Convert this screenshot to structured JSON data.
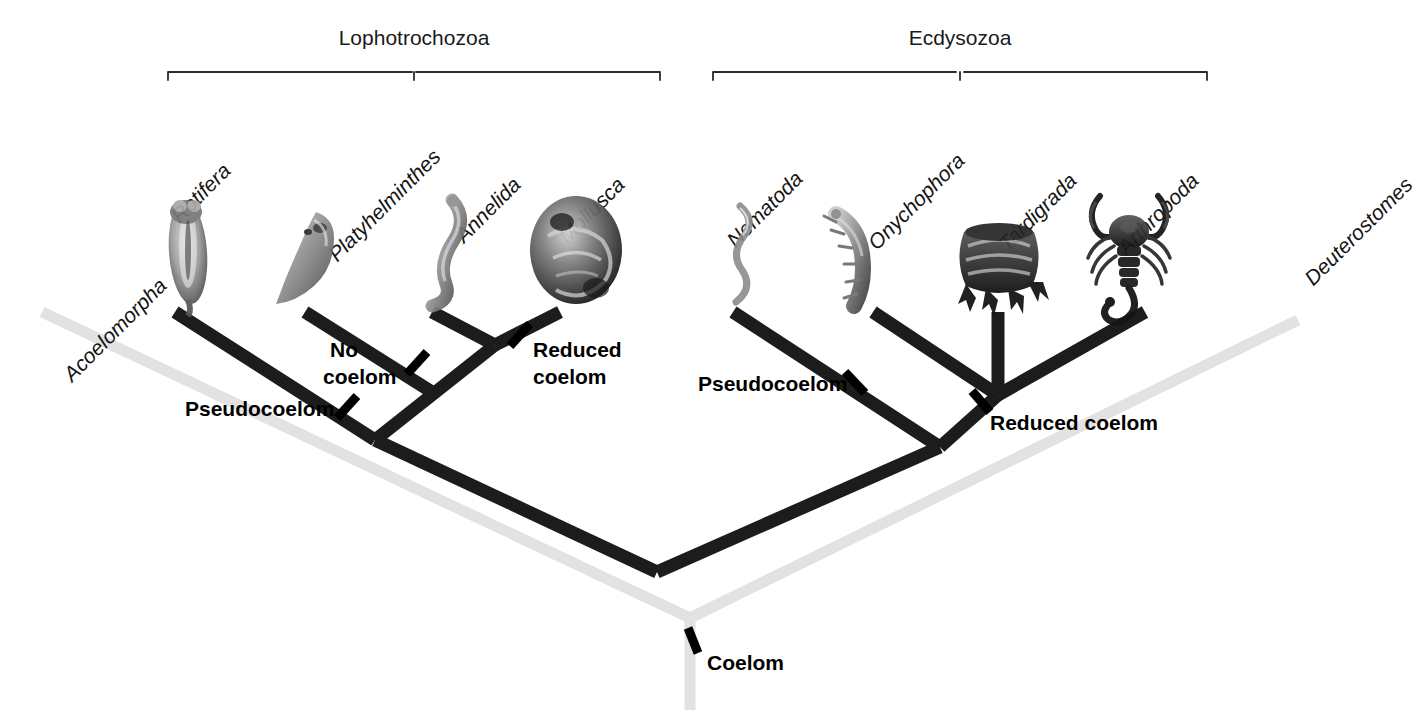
{
  "figure": {
    "type": "phylogenetic-cladogram",
    "title": "",
    "background_color": "#ffffff",
    "dark_branch_color": "#1c1c1c",
    "gray_branch_color": "#e2e2e2",
    "text_color": "#141414"
  },
  "clades": [
    {
      "id": "lophotrochozoa",
      "label": "Lophotrochozoa",
      "bracket_x1": 168,
      "bracket_x2": 660,
      "bracket_y": 72,
      "label_x": 414,
      "label_y": 45
    },
    {
      "id": "ecdysozoa",
      "label": "Ecdysozoa",
      "bracket_x1": 713,
      "bracket_x2": 1207,
      "bracket_y": 72,
      "label_x": 960,
      "label_y": 45
    }
  ],
  "taxa": [
    {
      "id": "acoelomorpha",
      "label": "Acoelomorpha",
      "label_x": 168,
      "label_y": 287,
      "tip_x": 42,
      "tip_y": 312,
      "group": "outgroup-gray"
    },
    {
      "id": "rotifera",
      "label": "Rotifera",
      "label_x": 232,
      "label_y": 170,
      "tip_x": 175,
      "tip_y": 312,
      "group": "lophotrochozoa"
    },
    {
      "id": "platyhelminthes",
      "label": "Platyhelminthes",
      "label_x": 432,
      "label_y": 170,
      "tip_x": 305,
      "tip_y": 312,
      "group": "lophotrochozoa"
    },
    {
      "id": "annelida",
      "label": "Annelida",
      "label_x": 520,
      "label_y": 186,
      "tip_x": 432,
      "tip_y": 312,
      "group": "lophotrochozoa"
    },
    {
      "id": "mollusca",
      "label": "Mollusca",
      "label_x": 620,
      "label_y": 186,
      "tip_x": 560,
      "tip_y": 312,
      "group": "lophotrochozoa"
    },
    {
      "id": "nematoda",
      "label": "Nematoda",
      "label_x": 800,
      "label_y": 180,
      "tip_x": 733,
      "tip_y": 312,
      "group": "ecdysozoa"
    },
    {
      "id": "onychophora",
      "label": "Onychophora",
      "label_x": 960,
      "label_y": 170,
      "tip_x": 873,
      "tip_y": 312,
      "group": "ecdysozoa"
    },
    {
      "id": "tardigrada",
      "label": "Tardigrada",
      "label_x": 1072,
      "label_y": 182,
      "tip_x": 998,
      "tip_y": 312,
      "group": "ecdysozoa"
    },
    {
      "id": "arthropoda",
      "label": "Arthropoda",
      "label_x": 1195,
      "label_y": 182,
      "tip_x": 1145,
      "tip_y": 312,
      "group": "ecdysozoa"
    },
    {
      "id": "deuterostomes",
      "label": "Deuterostomes",
      "label_x": 1398,
      "label_y": 185,
      "tip_x": 1298,
      "tip_y": 320,
      "group": "outgroup-gray"
    }
  ],
  "trait_marks": [
    {
      "id": "pseudocoelom-left",
      "label": "Pseudocoelom",
      "tick_x": 347,
      "tick_y": 407,
      "tick_angle": 45,
      "label_x": 185,
      "label_y": 416,
      "anchor": "start"
    },
    {
      "id": "no-coelom",
      "label": "No\ncoelom",
      "line1": "No",
      "line2": "coelom",
      "tick_x": 417,
      "tick_y": 363,
      "tick_angle": 45,
      "label_x": 328,
      "label_y": 356,
      "anchor": "start"
    },
    {
      "id": "reduced-coelom-left",
      "label": "Reduced\ncoelom",
      "line1": "Reduced",
      "line2": "coelom",
      "tick_x": 520,
      "tick_y": 335,
      "tick_angle": 45,
      "label_x": 533,
      "label_y": 357,
      "anchor": "start"
    },
    {
      "id": "pseudocoelom-right",
      "label": "Pseudocoelom",
      "tick_x": 855,
      "tick_y": 382,
      "tick_angle": -45,
      "label_x": 698,
      "label_y": 391,
      "anchor": "start"
    },
    {
      "id": "reduced-coelom-right",
      "label": "Reduced coelom",
      "line1": "Reduced coelom",
      "tick_x": 980,
      "tick_y": 401,
      "tick_angle": -45,
      "label_x": 988,
      "label_y": 430,
      "anchor": "start"
    },
    {
      "id": "coelom-root",
      "label": "Coelom",
      "tick_x": 693,
      "tick_y": 640,
      "tick_angle": -20,
      "label_x": 707,
      "label_y": 670,
      "anchor": "start"
    }
  ],
  "nodes": [
    {
      "id": "node-annelida-mollusca",
      "x": 495,
      "y": 345
    },
    {
      "id": "node-platy-clade",
      "x": 432,
      "y": 392
    },
    {
      "id": "node-rotifera-clade",
      "x": 375,
      "y": 440
    },
    {
      "id": "node-lophotrochozoa-root",
      "x": 657,
      "y": 572
    },
    {
      "id": "node-onycho-tardi-arthro",
      "x": 998,
      "y": 395
    },
    {
      "id": "node-ecdysozoa-inner",
      "x": 940,
      "y": 447
    },
    {
      "id": "node-gray-bilateria",
      "x": 690,
      "y": 618
    },
    {
      "id": "node-gray-root",
      "x": 690,
      "y": 706
    }
  ],
  "organisms": [
    {
      "id": "rotifera-image",
      "name": "rotifer-illustration",
      "left": 152,
      "top": 196,
      "width": 72,
      "height": 112
    },
    {
      "id": "platyhelminthes-image",
      "name": "flatworm-illustration",
      "left": 268,
      "top": 206,
      "width": 74,
      "height": 96
    },
    {
      "id": "annelida-image",
      "name": "annelid-worm-illustration",
      "left": 398,
      "top": 196,
      "width": 74,
      "height": 112
    },
    {
      "id": "mollusca-image",
      "name": "mollusc-shell-illustration",
      "left": 528,
      "top": 196,
      "width": 96,
      "height": 110
    },
    {
      "id": "nematoda-image",
      "name": "nematode-illustration",
      "left": 714,
      "top": 200,
      "width": 52,
      "height": 106
    },
    {
      "id": "onychophora-image",
      "name": "velvet-worm-illustration",
      "left": 824,
      "top": 204,
      "width": 80,
      "height": 104
    },
    {
      "id": "tardigrada-image",
      "name": "tardigrade-illustration",
      "left": 952,
      "top": 208,
      "width": 96,
      "height": 100
    },
    {
      "id": "arthropoda-image",
      "name": "scorpion-illustration",
      "left": 1076,
      "top": 186,
      "width": 104,
      "height": 124
    }
  ]
}
